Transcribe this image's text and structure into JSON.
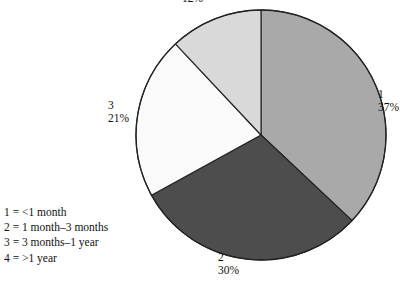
{
  "chart_data": {
    "type": "pie",
    "title": "",
    "subtitle": "",
    "xlabel": "",
    "ylabel": "",
    "grid": false,
    "legend_position": "bottom-left",
    "start_angle_deg": 0,
    "direction": "clockwise",
    "categories": [
      "1",
      "2",
      "3",
      "4"
    ],
    "values": [
      37,
      30,
      21,
      12
    ],
    "units": "%",
    "slices": [
      {
        "category": "1",
        "value": 37,
        "percent_label": "37%",
        "category_label": "1",
        "color": "#a9a9a9",
        "legend_text": "1 = <1 month"
      },
      {
        "category": "2",
        "value": 30,
        "percent_label": "30%",
        "category_label": "2",
        "color": "#4d4d4d",
        "legend_text": "2 = 1 month–3 months"
      },
      {
        "category": "3",
        "value": 21,
        "percent_label": "21%",
        "category_label": "3",
        "color": "#fafafa",
        "legend_text": "3 = 3 months–1 year"
      },
      {
        "category": "4",
        "value": 12,
        "percent_label": "12%",
        "category_label": "",
        "color": "#d9d9d9",
        "legend_text": "4 = >1 year"
      }
    ],
    "annotations": [
      "Category 4 numeric label is cropped off the top edge of the figure; only its 12% value is visible."
    ]
  },
  "legend": {
    "rows": [
      "1 = <1 month",
      "2 = 1 month–3 months",
      "3 = 3 months–1 year",
      "4 = >1 year"
    ]
  },
  "colors": {
    "background": "#ffffff",
    "outline": "#222222",
    "text": "#111111",
    "slice_1": "#a9a9a9",
    "slice_2": "#4d4d4d",
    "slice_3": "#fafafa",
    "slice_4": "#d9d9d9"
  },
  "geometry": {
    "center_x": 261,
    "center_y": 135,
    "radius": 125
  }
}
